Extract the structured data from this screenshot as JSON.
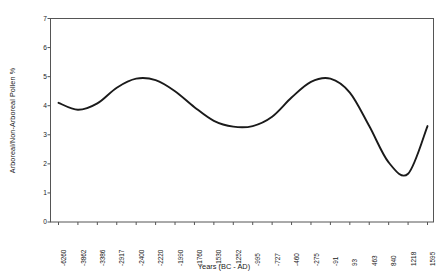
{
  "chart_data": {
    "type": "line",
    "title": "",
    "xlabel": "Years (BC - AD)",
    "ylabel": "Arboreal/Non-Arboreal Pollen %",
    "ylim": [
      0,
      7
    ],
    "y_ticks": [
      0,
      1,
      2,
      3,
      4,
      5,
      6,
      7
    ],
    "grid": false,
    "legend": null,
    "x_tick_labels": [
      "-6260",
      "-3862",
      "-3386",
      "-2917",
      "-2400",
      "-2220",
      "-1990",
      "-1760",
      "-1530",
      "-1252",
      "-995",
      "-727",
      "-460",
      "-275",
      "-91",
      "93",
      "463",
      "840",
      "1218",
      "1595"
    ],
    "categories": [
      "-6260",
      "-3862",
      "-3386",
      "-2917",
      "-2400",
      "-2220",
      "-1990",
      "-1760",
      "-1530",
      "-1252",
      "-995",
      "-727",
      "-460",
      "-275",
      "-91",
      "93",
      "463",
      "840",
      "1218",
      "1595"
    ],
    "values": [
      4.1,
      3.86,
      4.08,
      4.62,
      4.93,
      4.88,
      4.5,
      3.95,
      3.48,
      3.28,
      3.3,
      3.62,
      4.28,
      4.82,
      4.93,
      4.45,
      3.3,
      2.05,
      1.66,
      3.3
    ],
    "series": [
      {
        "name": "Arboreal/Non-Arboreal Pollen %",
        "color": "#1a1a1a",
        "values": [
          4.1,
          3.86,
          4.08,
          4.62,
          4.93,
          4.88,
          4.5,
          3.95,
          3.48,
          3.28,
          3.3,
          3.62,
          4.28,
          4.82,
          4.93,
          4.45,
          3.3,
          2.05,
          1.66,
          3.3
        ]
      }
    ],
    "line_color": "#1a1a1a",
    "frame_color": "#555555",
    "background": "#ffffff"
  }
}
